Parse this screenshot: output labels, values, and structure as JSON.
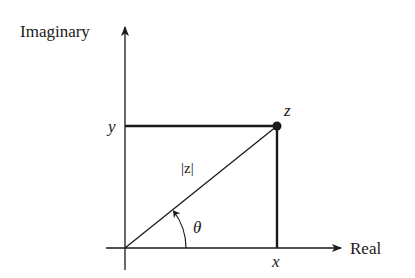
{
  "diagram": {
    "axes": {
      "vertical_label": "Imaginary",
      "horizontal_label": "Real"
    },
    "labels": {
      "point": "z",
      "y_coordinate": "y",
      "x_coordinate": "x",
      "magnitude": "|z|",
      "angle": "θ"
    },
    "colors": {
      "ink": "#1a1a1a",
      "background": "#ffffff"
    }
  }
}
